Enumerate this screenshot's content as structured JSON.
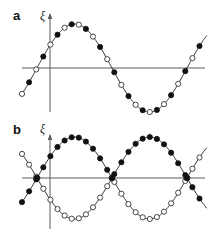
{
  "figure": {
    "width": 209,
    "height": 234,
    "background": "#ffffff"
  },
  "panels": [
    {
      "id": "a",
      "label": "a",
      "ylabel": "ξ",
      "mode": "acoustic",
      "axis": {
        "origin_x": 50,
        "baseline_y": 68,
        "x_axis_end": 205,
        "y_axis_top": 14,
        "y_axis_bottom": 112
      },
      "curves": [
        {
          "name": "displacement-wave",
          "phase_deg": 0,
          "amplitude": 44,
          "wavelength": 150,
          "x_start": 22,
          "x_end": 207
        }
      ],
      "marker_count": 26,
      "marker_spacing": 7.1,
      "marker_start_x": 22,
      "marker_pattern": [
        "open",
        "filled"
      ]
    },
    {
      "id": "b",
      "label": "b",
      "ylabel": "ξ",
      "mode": "optical",
      "axis": {
        "origin_x": 50,
        "baseline_y": 61,
        "x_axis_end": 205,
        "y_axis_top": 18,
        "y_axis_bottom": 112
      },
      "curves": [
        {
          "name": "sublattice-wave-up",
          "phase_deg": 0,
          "amplitude": 41,
          "wavelength": 150,
          "x_start": 22,
          "x_end": 207,
          "marker_style_first_half": "filled",
          "marker_style_second_half": "open"
        },
        {
          "name": "sublattice-wave-down",
          "phase_deg": 180,
          "amplitude": 41,
          "wavelength": 150,
          "x_start": 22,
          "x_end": 207,
          "marker_style_first_half": "open",
          "marker_style_second_half": "filled"
        }
      ],
      "node_positions_x": [
        37,
        112,
        187
      ],
      "marker_count_per_curve": 26,
      "marker_spacing": 7.1,
      "marker_start_x": 22
    }
  ],
  "colors": {
    "axis": "#5a5a5a",
    "curve": "#2b2b2b",
    "marker_filled": "#111111",
    "marker_open_fill": "#ffffff",
    "marker_open_stroke": "#333333",
    "text": "#111111"
  },
  "markers": {
    "filled_radius": 2.6,
    "open_radius": 2.6,
    "legend_filled_meaning": "atom type 1",
    "legend_open_meaning": "atom type 2"
  },
  "chart_data": {
    "type": "line",
    "title": "",
    "xlabel": "",
    "ylabel": "ξ",
    "grid": false,
    "legend": "none",
    "panels": [
      {
        "panel": "a",
        "label": "a",
        "mode": "acoustic",
        "series": [
          {
            "name": "displacement",
            "form": "sin",
            "amplitude": 1.0,
            "phase_deg": 0,
            "wavelength_px": 150,
            "markers_alternate": [
              "open",
              "filled"
            ]
          }
        ]
      },
      {
        "panel": "b",
        "label": "b",
        "mode": "optical",
        "series": [
          {
            "name": "sublattice-1",
            "form": "sin",
            "amplitude": 1.0,
            "phase_deg": 0,
            "wavelength_px": 150
          },
          {
            "name": "sublattice-2",
            "form": "sin",
            "amplitude": 1.0,
            "phase_deg": 180,
            "wavelength_px": 150
          }
        ]
      }
    ]
  }
}
